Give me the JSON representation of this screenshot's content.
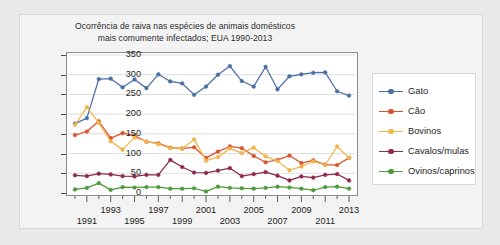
{
  "title": {
    "line1": "Ocorrência de raiva nas espécies de animais domésticos",
    "line2": "mais comumente infectados; EUA 1990-2013"
  },
  "axis": {
    "y_ticks": [
      "350",
      "300",
      "250",
      "200",
      "150",
      "100",
      "50",
      "0"
    ],
    "x_ticks_upper": [
      "1993",
      "1997",
      "2001",
      "2005",
      "2009",
      "2013"
    ],
    "x_ticks_lower": [
      "1991",
      "1995",
      "1999",
      "2003",
      "2007",
      "2011"
    ]
  },
  "legend": {
    "items": [
      {
        "label": "Gato",
        "color": "#4a6fa5"
      },
      {
        "label": "Cão",
        "color": "#d9542b"
      },
      {
        "label": "Bovinos",
        "color": "#f0b54b"
      },
      {
        "label": "Cavalos/mulas",
        "color": "#8e2a4e"
      },
      {
        "label": "Ovinos/caprinos",
        "color": "#4e9a3d"
      }
    ]
  },
  "caption": "",
  "chart_data": {
    "type": "line",
    "title": "Ocorrência de raiva nas espécies de animais domésticos mais comumente infectados; EUA 1990-2013",
    "xlabel": "",
    "ylabel": "",
    "ylim": [
      0,
      350
    ],
    "ytick_step": 50,
    "grid": true,
    "legend_position": "right",
    "x": [
      1990,
      1991,
      1992,
      1993,
      1994,
      1995,
      1996,
      1997,
      1998,
      1999,
      2000,
      2001,
      2002,
      2003,
      2004,
      2005,
      2006,
      2007,
      2008,
      2009,
      2010,
      2011,
      2012,
      2013
    ],
    "series": [
      {
        "name": "Gato",
        "color": "#4a6fa5",
        "values": [
          176,
          190,
          289,
          290,
          268,
          288,
          266,
          301,
          283,
          278,
          249,
          270,
          300,
          322,
          284,
          270,
          320,
          263,
          296,
          301,
          305,
          306,
          258,
          247
        ]
      },
      {
        "name": "Cão",
        "color": "#d9542b",
        "values": [
          147,
          156,
          182,
          139,
          152,
          146,
          130,
          126,
          115,
          113,
          116,
          89,
          105,
          118,
          114,
          94,
          78,
          84,
          95,
          76,
          83,
          72,
          71,
          89
        ]
      },
      {
        "name": "Bovinos",
        "color": "#f0b54b",
        "values": [
          173,
          218,
          178,
          131,
          110,
          141,
          131,
          124,
          114,
          112,
          136,
          82,
          91,
          113,
          101,
          115,
          93,
          81,
          58,
          67,
          80,
          71,
          118,
          89
        ]
      },
      {
        "name": "Cavalos/mulas",
        "color": "#8e2a4e",
        "values": [
          45,
          43,
          49,
          47,
          43,
          42,
          46,
          46,
          84,
          66,
          52,
          51,
          57,
          63,
          43,
          48,
          53,
          44,
          32,
          42,
          39,
          46,
          48,
          32
        ]
      },
      {
        "name": "Ovinos/caprinos",
        "color": "#4e9a3d",
        "values": [
          9,
          13,
          25,
          8,
          15,
          14,
          15,
          15,
          11,
          11,
          12,
          4,
          16,
          13,
          12,
          11,
          13,
          16,
          14,
          11,
          7,
          15,
          16,
          11
        ]
      }
    ]
  }
}
